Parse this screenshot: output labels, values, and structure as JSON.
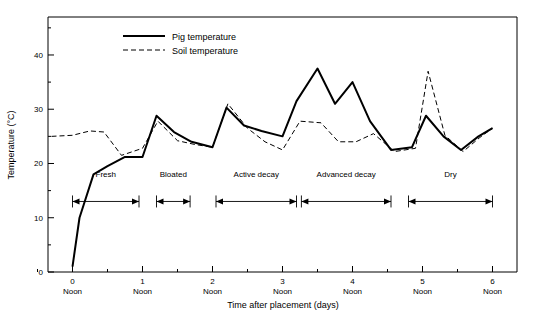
{
  "chart_data": {
    "type": "line",
    "title": "",
    "xlabel": "Time after placement (days)",
    "ylabel": "Temperature (°C)",
    "xlim": [
      -0.35,
      6.35
    ],
    "ylim": [
      0,
      47
    ],
    "grid": false,
    "legend_position": "top-center",
    "x_tick_labels": [
      "0",
      "1",
      "2",
      "3",
      "4",
      "5",
      "6"
    ],
    "x_tick_values": [
      0,
      1,
      2,
      3,
      4,
      5,
      6
    ],
    "x_tick_sublabel": "Noon",
    "x_minor_ticks": [
      -0.5,
      0.5,
      1.5,
      2.5,
      3.5,
      4.5,
      5.5
    ],
    "y_tick_labels": [
      "0",
      "10",
      "20",
      "30",
      "40"
    ],
    "y_tick_values": [
      0,
      10,
      20,
      30,
      40
    ],
    "y_minor_ticks": [
      5,
      15,
      25,
      35,
      45
    ],
    "series": [
      {
        "name": "Pig temperature",
        "style": "solid",
        "color": "#000000",
        "x": [
          0.0,
          0.1,
          0.3,
          0.5,
          0.75,
          1.0,
          1.2,
          1.45,
          1.7,
          2.0,
          2.2,
          2.45,
          2.7,
          3.0,
          3.2,
          3.5,
          3.75,
          4.0,
          4.25,
          4.55,
          4.85,
          5.05,
          5.3,
          5.55,
          5.8,
          6.0
        ],
        "y": [
          1.0,
          10.0,
          18.0,
          19.5,
          21.2,
          21.2,
          28.8,
          25.8,
          24.0,
          23.0,
          30.3,
          27.0,
          26.0,
          25.0,
          31.5,
          37.5,
          31.0,
          35.0,
          27.8,
          22.5,
          23.0,
          28.8,
          25.0,
          22.5,
          25.0,
          26.5
        ]
      },
      {
        "name": "Soil temperature",
        "style": "dashed",
        "color": "#000000",
        "x": [
          -0.3,
          0.0,
          0.25,
          0.45,
          0.7,
          1.0,
          1.22,
          1.5,
          1.75,
          2.0,
          2.22,
          2.5,
          2.75,
          3.0,
          3.25,
          3.55,
          3.8,
          4.05,
          4.3,
          4.6,
          4.9,
          5.08,
          5.32,
          5.58,
          5.82,
          6.0
        ],
        "y": [
          25.0,
          25.2,
          26.0,
          25.8,
          21.5,
          22.8,
          27.8,
          24.2,
          23.5,
          23.0,
          31.0,
          26.5,
          24.0,
          22.5,
          27.8,
          27.5,
          24.0,
          24.0,
          25.5,
          22.2,
          22.8,
          37.0,
          25.2,
          22.2,
          24.8,
          26.5
        ]
      }
    ],
    "stages": [
      {
        "label": "Fresh",
        "start": 0.0,
        "end": 0.95
      },
      {
        "label": "Bloated",
        "start": 1.2,
        "end": 1.68
      },
      {
        "label": "Active decay",
        "start": 2.05,
        "end": 3.2
      },
      {
        "label": "Advanced decay",
        "start": 3.27,
        "end": 4.55
      },
      {
        "label": "Dry",
        "start": 4.8,
        "end": 6.0
      }
    ],
    "stage_band_y": 13.0,
    "stage_label_y": 17.5
  }
}
